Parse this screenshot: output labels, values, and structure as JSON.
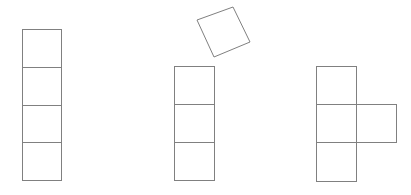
{
  "canvas": {
    "width": 411,
    "height": 195,
    "background_color": "#ffffff",
    "stroke_color": "#808080",
    "stroke_width": 1,
    "fill_color": "#ffffff"
  },
  "figures": [
    {
      "name": "left-tetromino-column",
      "label": "vertical column of 4 squares",
      "square_count": 4,
      "cell_size": 39,
      "origin": {
        "x": 22,
        "y": 29
      },
      "bounds": {
        "x": 22,
        "y": 29,
        "width": 39,
        "height": 151
      },
      "cells": [
        {
          "x": 22,
          "y": 29,
          "width": 39,
          "height": 38
        },
        {
          "x": 22,
          "y": 67,
          "width": 39,
          "height": 38
        },
        {
          "x": 22,
          "y": 105,
          "width": 39,
          "height": 37
        },
        {
          "x": 22,
          "y": 142,
          "width": 39,
          "height": 38
        }
      ]
    },
    {
      "name": "rotated-square",
      "label": "single square rotated",
      "square_count": 1,
      "side_length": 39,
      "rotation_degrees": -26,
      "center": {
        "x": 223.5,
        "y": 32
      },
      "vertices": [
        {
          "x": 233,
          "y": 7
        },
        {
          "x": 250,
          "y": 42
        },
        {
          "x": 214,
          "y": 57
        },
        {
          "x": 197,
          "y": 20
        }
      ]
    },
    {
      "name": "middle-tromino-column",
      "label": "vertical column of 3 squares",
      "square_count": 3,
      "cell_size": 40,
      "origin": {
        "x": 174,
        "y": 66
      },
      "bounds": {
        "x": 174,
        "y": 66,
        "width": 40,
        "height": 114
      },
      "cells": [
        {
          "x": 174,
          "y": 66,
          "width": 40,
          "height": 38
        },
        {
          "x": 174,
          "y": 104,
          "width": 40,
          "height": 38
        },
        {
          "x": 174,
          "y": 142,
          "width": 40,
          "height": 38
        }
      ]
    },
    {
      "name": "right-t-tetromino",
      "label": "vertical column of 3 squares with one square attached right of middle",
      "square_count": 4,
      "cell_size": 40,
      "origin": {
        "x": 316,
        "y": 66
      },
      "bounds": {
        "x": 316,
        "y": 66,
        "width": 80,
        "height": 115
      },
      "cells": [
        {
          "x": 316,
          "y": 66,
          "width": 40,
          "height": 38
        },
        {
          "x": 316,
          "y": 104,
          "width": 40,
          "height": 38
        },
        {
          "x": 316,
          "y": 142,
          "width": 40,
          "height": 39
        },
        {
          "x": 356,
          "y": 104,
          "width": 40,
          "height": 38
        }
      ]
    }
  ]
}
